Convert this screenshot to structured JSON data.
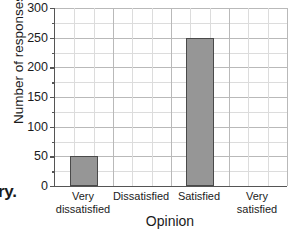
{
  "chart_data": {
    "type": "bar",
    "title": "",
    "xlabel": "Opinion",
    "ylabel": "Number of responses",
    "categories": [
      "Very\ndissatisfied",
      "Dissatisfied",
      "Satisfied",
      "Very\nsatisfied"
    ],
    "values": [
      50,
      0,
      250,
      0
    ],
    "ylim": [
      0,
      300
    ],
    "ytick_labels": [
      "0",
      "50",
      "100",
      "150",
      "200",
      "250",
      "300"
    ],
    "ytick_values": [
      0,
      50,
      100,
      150,
      200,
      250,
      300
    ],
    "yminor_step": 25,
    "grid": true,
    "legend": "none",
    "bar_color": "#969696",
    "bar_edge_color": "#4a4a4a",
    "grid_color": "#b9b9b9",
    "axis_color": "#555555"
  },
  "annotations": {
    "edge_text_fragment": "ry."
  }
}
